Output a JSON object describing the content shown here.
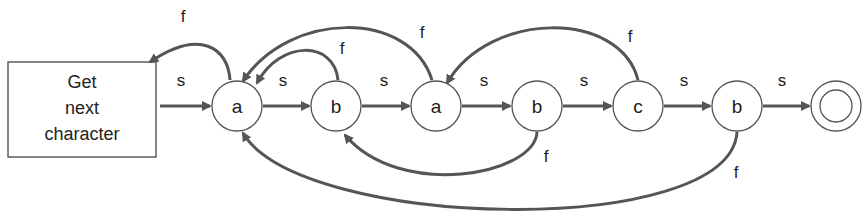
{
  "diagram": {
    "type": "finite-state-machine",
    "start_box": {
      "lines": [
        "Get",
        "next",
        "character"
      ]
    },
    "nodes": [
      {
        "id": "n1",
        "label": "a"
      },
      {
        "id": "n2",
        "label": "b"
      },
      {
        "id": "n3",
        "label": "a"
      },
      {
        "id": "n4",
        "label": "b"
      },
      {
        "id": "n5",
        "label": "c"
      },
      {
        "id": "n6",
        "label": "b"
      },
      {
        "id": "final",
        "label": ""
      }
    ],
    "edges": [
      {
        "from": "start_box",
        "to": "n1",
        "label": "s"
      },
      {
        "from": "n1",
        "to": "n2",
        "label": "s"
      },
      {
        "from": "n2",
        "to": "n3",
        "label": "s"
      },
      {
        "from": "n3",
        "to": "n4",
        "label": "s"
      },
      {
        "from": "n4",
        "to": "n5",
        "label": "s"
      },
      {
        "from": "n5",
        "to": "n6",
        "label": "s"
      },
      {
        "from": "n6",
        "to": "final",
        "label": "s"
      },
      {
        "from": "n1",
        "to": "start_box",
        "label": "f"
      },
      {
        "from": "n2",
        "to": "n1",
        "label": "f"
      },
      {
        "from": "n3",
        "to": "n1",
        "label": "f"
      },
      {
        "from": "n4",
        "to": "n2",
        "label": "f"
      },
      {
        "from": "n5",
        "to": "n3",
        "label": "f"
      },
      {
        "from": "n6",
        "to": "n1",
        "label": "f"
      }
    ],
    "colors": {
      "stroke": "#555555",
      "text": "#222222",
      "background": "#ffffff"
    }
  }
}
